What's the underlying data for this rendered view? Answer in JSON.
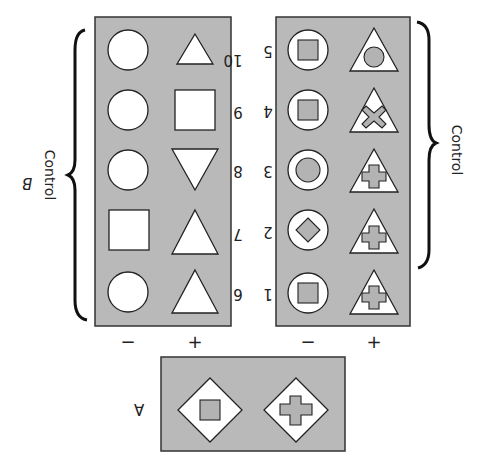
{
  "figure": {
    "orientation": "rotated-180",
    "panel_fill": "#b9b9b9",
    "shape_fill": "#ffffff",
    "panel_b": {
      "label": "B",
      "bracket_label": "Control",
      "column_labels": [
        "−",
        "+"
      ],
      "rows": [
        {
          "number": "10",
          "minus": "circle",
          "plus": "triangle"
        },
        {
          "number": "9",
          "minus": "circle",
          "plus": "square"
        },
        {
          "number": "8",
          "minus": "circle",
          "plus": "inverted-triangle"
        },
        {
          "number": "7",
          "minus": "square",
          "plus": "triangle"
        },
        {
          "number": "6",
          "minus": "circle",
          "plus": "triangle"
        }
      ]
    },
    "panel_right": {
      "bracket_label": "Control",
      "column_labels": [
        "−",
        "+"
      ],
      "rows": [
        {
          "number": "5",
          "minus": "circle-with-square",
          "plus": "triangle-with-circle"
        },
        {
          "number": "4",
          "minus": "circle-with-square",
          "plus": "triangle-with-x"
        },
        {
          "number": "3",
          "minus": "circle-with-circle",
          "plus": "triangle-with-cross"
        },
        {
          "number": "2",
          "minus": "circle-with-diamond",
          "plus": "triangle-with-cross"
        },
        {
          "number": "1",
          "minus": "circle-with-square",
          "plus": "triangle-with-cross"
        }
      ]
    },
    "panel_a": {
      "label": "A",
      "items": [
        "diamond-with-square",
        "diamond-with-cross"
      ]
    }
  }
}
